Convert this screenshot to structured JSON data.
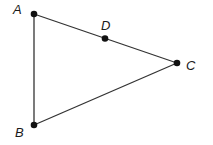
{
  "diagram": {
    "type": "geometry-triangle",
    "points": [
      {
        "id": "A",
        "label": "A"
      },
      {
        "id": "B",
        "label": "B"
      },
      {
        "id": "C",
        "label": "C"
      },
      {
        "id": "D",
        "label": "D",
        "on_segment": "AC"
      }
    ],
    "segments": [
      {
        "from": "A",
        "to": "C"
      },
      {
        "from": "A",
        "to": "B"
      },
      {
        "from": "B",
        "to": "C"
      }
    ],
    "colors": {
      "line": "#333333",
      "point": "#111111",
      "label": "#1a1a1a"
    }
  }
}
